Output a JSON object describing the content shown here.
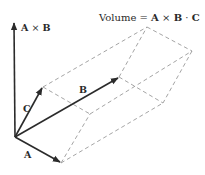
{
  "diagram": {
    "title": "Volume = A × B · C",
    "title_parts": {
      "prefix": "Volume = ",
      "a": "A",
      "cross": " × ",
      "b": "B",
      "dot": " · ",
      "c": "C"
    },
    "labels": {
      "axb": {
        "a": "A",
        "cross": " × ",
        "b": "B"
      },
      "a": "A",
      "b": "B",
      "c": "C"
    },
    "colors": {
      "vector": "#2b2b2b",
      "dashed_edge": "#9a9a9a",
      "text": "#2a2a2a"
    },
    "points": {
      "origin": [
        15,
        137
      ],
      "a_tip": [
        61,
        163
      ],
      "b_tip": [
        119,
        77
      ],
      "c_tip": [
        43,
        87
      ],
      "axb_tip": [
        14,
        22
      ],
      "b_plus_c": [
        147,
        27
      ],
      "a_plus_b_plus_c": [
        192,
        51
      ],
      "a_plus_b": [
        163,
        103
      ],
      "a_plus_c": [
        90,
        114
      ]
    }
  }
}
